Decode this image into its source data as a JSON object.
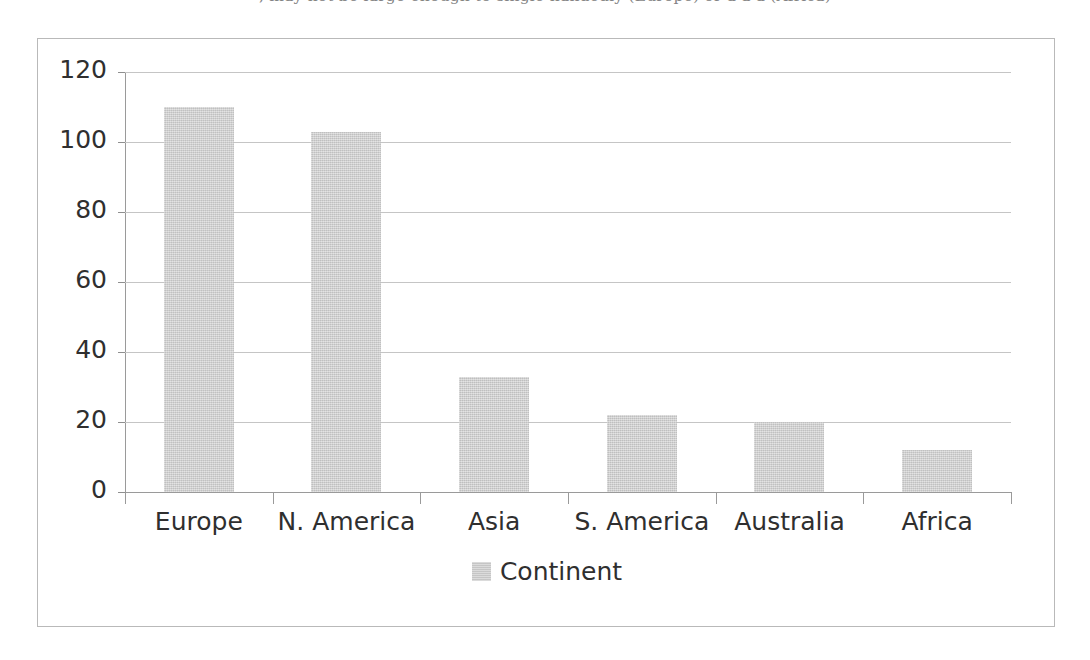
{
  "clipped_caption": ", may not be large enough to single-handedly (Europe) or a a a (Africa)",
  "chart_data": {
    "type": "bar",
    "title": "",
    "subtitle": "",
    "xlabel": "",
    "ylabel": "",
    "categories": [
      "Europe",
      "N. America",
      "Asia",
      "S. America",
      "Australia",
      "Africa"
    ],
    "series": [
      {
        "name": "Continent",
        "values": [
          110,
          103,
          33,
          22,
          20,
          12
        ],
        "color": "#cccccc"
      }
    ],
    "ylim": [
      0,
      120
    ],
    "y_ticks": [
      0,
      20,
      40,
      60,
      80,
      100,
      120
    ],
    "y_tick_labels": [
      "0",
      "20",
      "40",
      "60",
      "80",
      "100",
      "120"
    ],
    "grid": true,
    "grid_axis": "y",
    "legend": {
      "position": "bottom",
      "entries": [
        {
          "label": "Continent",
          "color": "#cccccc"
        }
      ]
    },
    "frame_border_color": "#b9b9b9",
    "gridline_color": "#c5c5c5",
    "axis_color": "#9a9a9a",
    "text_color": "#2f2f2f"
  }
}
